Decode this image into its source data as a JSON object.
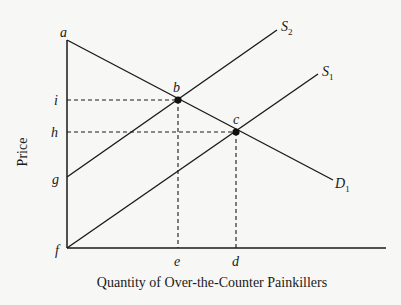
{
  "diagram": {
    "x_axis_title": "Quantity of Over-the-Counter Painkillers",
    "y_axis_title": "Price",
    "curves": {
      "s2": {
        "label": "S",
        "subscript": "2"
      },
      "s1": {
        "label": "S",
        "subscript": "1"
      },
      "d1": {
        "label": "D",
        "subscript": "1"
      }
    },
    "points": {
      "a": "a",
      "b": "b",
      "c": "c",
      "f": "f",
      "g": "g",
      "h": "h",
      "i": "i",
      "e": "e",
      "d": "d"
    }
  }
}
